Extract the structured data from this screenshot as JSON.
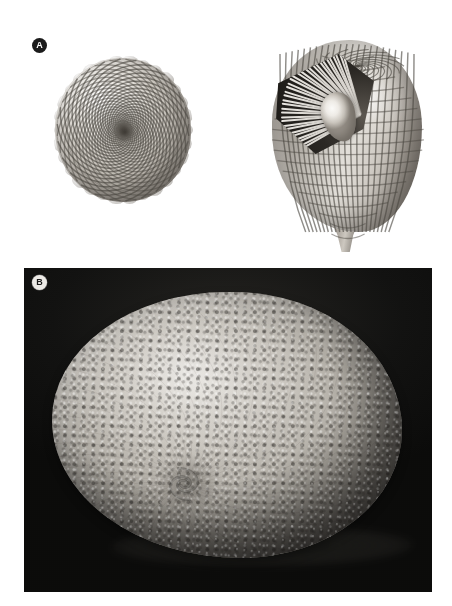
{
  "figure": {
    "caption_panels": [
      "A",
      "B"
    ],
    "background_color": "#ffffff",
    "width_px": 452,
    "height_px": 606
  },
  "panel_a": {
    "tag": "A",
    "tag_style": "dark-circle-white-letter",
    "background_color": "#ffffff",
    "models": [
      {
        "name": "apical-view-model",
        "view": "apical",
        "description": "Computer-generated shell model seen from the apex showing a double logarithmic spiral grid of rectangular surface elements converging on a central protoconch.",
        "shading": "grayscale diffuse",
        "grid_type": "double-logarithmic-spiral",
        "surface": "tuberculate-reticulate"
      },
      {
        "name": "cutaway-lateral-model",
        "view": "lateral-cutaway",
        "description": "Same model in oblique lateral view, sectioned to reveal radial internal septa and an ovoid inner chamber; outer wall carries the reticulate spiral grid and tapers to a basal spout.",
        "shading": "grayscale diffuse",
        "features": [
          "radial-septa",
          "inner-chamber",
          "basal-spout",
          "reticulate-grid"
        ]
      }
    ]
  },
  "panel_b": {
    "tag": "B",
    "tag_style": "light-circle-dark-letter",
    "photo": {
      "name": "specimen-photograph",
      "medium": "grayscale photograph",
      "subject": "coiled shell specimen with densely tuberculate surface",
      "background": "dark gradient backdrop above, pale illuminated floor below",
      "lighting": "single key light from upper left",
      "shadow": "cast shadow to lower right on floor",
      "features": [
        "spiral-coiling",
        "tubercle-rows",
        "growth-whorls",
        "umbilical-spiral-centre"
      ]
    },
    "frame": {
      "left": 24,
      "top": 268,
      "width": 408,
      "height": 324
    }
  },
  "colors": {
    "page_background": "#ffffff",
    "panel_b_backdrop_dark": "#121211",
    "panel_b_floor_light": "#e2e0dc",
    "model_highlight": "#f2f0ec",
    "model_midtone": "#b5b0a8",
    "model_shadow": "#4b4741",
    "tag_dark_fill": "#1b1b1b",
    "tag_light_fill": "#eceae6"
  }
}
